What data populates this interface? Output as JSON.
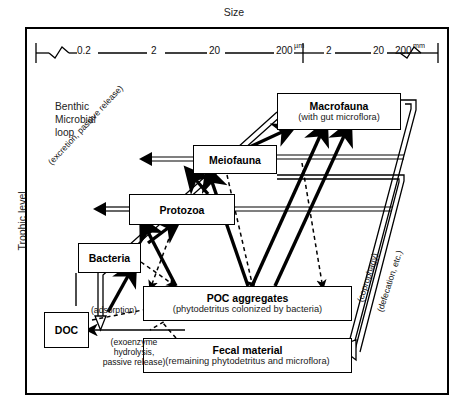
{
  "figure": {
    "top_axis_label": "Size",
    "left_axis_label": "Trophic level",
    "corner_note": "Benthic\nMicrobial\nloop"
  },
  "scale": {
    "ticks": [
      "0.2",
      "2",
      "20",
      "200",
      "2",
      "20",
      "200"
    ],
    "unit_micro": "µm",
    "unit_milli": "mm"
  },
  "boxes": {
    "macrofauna": {
      "title": "Macrofauna",
      "subtitle": "(with gut microflora)"
    },
    "meiofauna": {
      "title": "Meiofauna",
      "subtitle": ""
    },
    "protozoa": {
      "title": "Protozoa",
      "subtitle": ""
    },
    "bacteria": {
      "title": "Bacteria",
      "subtitle": ""
    },
    "doc": {
      "title": "DOC",
      "subtitle": ""
    },
    "poc": {
      "title": "POC aggregates",
      "subtitle": "(phytodetritus colonized by bacteria)"
    },
    "fecal": {
      "title": "Fecal material",
      "subtitle": "(remaining phytodetritus and microflora)"
    }
  },
  "annotations": {
    "excretion": "(excretion, passive release)",
    "adsorption": "(adsorption)",
    "exoenzyme": "(exoenzyme\nhydrolysis,\npassive release)",
    "coprophagy": "(coprophagy)",
    "defecation": "(defecation, etc.)"
  },
  "colors": {
    "ink": "#000000",
    "paper": "#ffffff",
    "muted": "#222222"
  }
}
